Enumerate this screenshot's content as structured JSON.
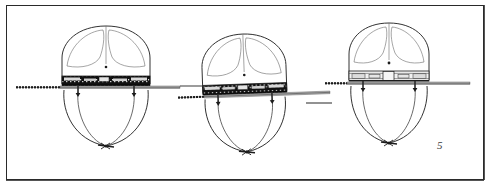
{
  "plate": {
    "title": "Three views of balloon-type apparatus with horizontal spar",
    "medium": "engraved line drawing on paper",
    "background_color": "#ffffff",
    "ink_color": "#1c1c1c",
    "border_color": "#2a2a2a",
    "figure_mark": "5"
  },
  "figures": [
    {
      "id": "figure-left",
      "label": "left view",
      "center_x": 106,
      "band_y": 84,
      "envelope": {
        "dome_lobes": 2,
        "center_dot": true,
        "shape": "rounded-dome-over-tapered-hull"
      },
      "spar": {
        "orientation": "horizontal",
        "left_end_x": 16,
        "right_end_x": 180,
        "hatched_segment": "left",
        "tilt_degrees": 0
      },
      "equipment_band": {
        "style": "dense-dark-hatched",
        "segments": 5
      },
      "suspension": {
        "lines": 2,
        "bottom_knot": true,
        "knot_x": 106,
        "knot_y": 146
      }
    },
    {
      "id": "figure-center",
      "label": "center view",
      "center_x": 245,
      "band_y": 92,
      "envelope": {
        "dome_lobes": 2,
        "center_dot": true,
        "shape": "rounded-dome-over-tapered-hull"
      },
      "spar": {
        "orientation": "horizontal",
        "left_end_x": 178,
        "right_end_x": 330,
        "hatched_segment": "left",
        "tilt_degrees": -2
      },
      "equipment_band": {
        "style": "dense-dark-hatched",
        "segments": 5
      },
      "suspension": {
        "lines": 2,
        "bottom_knot": true,
        "knot_x": 245,
        "knot_y": 152
      }
    },
    {
      "id": "figure-right",
      "label": "right view",
      "center_x": 389,
      "band_y": 80,
      "envelope": {
        "dome_lobes": 2,
        "center_dot": true,
        "shape": "rounded-dome-over-tapered-hull"
      },
      "spar": {
        "orientation": "horizontal",
        "left_end_x": 325,
        "right_end_x": 470,
        "hatched_segment": "left",
        "tilt_degrees": 0
      },
      "equipment_band": {
        "style": "light-outlined-segments",
        "segments": 5
      },
      "suspension": {
        "lines": 2,
        "bottom_knot": true,
        "knot_x": 389,
        "knot_y": 143
      }
    }
  ],
  "detached_rules": [
    {
      "id": "rule-upper-center",
      "x1": 180,
      "y1": 86,
      "x2": 213,
      "y2": 86
    },
    {
      "id": "rule-lower-right",
      "x1": 306,
      "y1": 103,
      "x2": 330,
      "y2": 103
    }
  ]
}
